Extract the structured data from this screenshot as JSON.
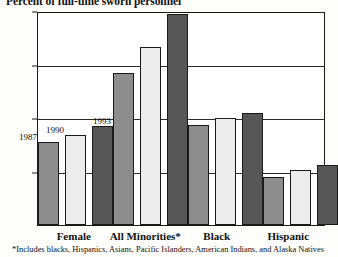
{
  "chart_data": {
    "type": "bar",
    "title": "Percent of full-time sworn personnel",
    "xlabel": "",
    "ylabel": "",
    "ylim": [
      0,
      20
    ],
    "ytick_labels": [
      "20%",
      "15%",
      "10%",
      "5%",
      "0%"
    ],
    "ytick_values": [
      20,
      15,
      10,
      5,
      0
    ],
    "grid": true,
    "legend_position": "inline-on-first-group",
    "categories": [
      "Female",
      "All Minorities*",
      "Black",
      "Hispanic"
    ],
    "series": [
      {
        "name": "1987",
        "color": "#8d8d8d",
        "values": [
          7.8,
          14.3,
          9.4,
          4.5
        ]
      },
      {
        "name": "1990",
        "color": "#ececec",
        "values": [
          8.5,
          16.8,
          10.1,
          5.2
        ]
      },
      {
        "name": "1993",
        "color": "#565656",
        "values": [
          9.3,
          19.9,
          10.6,
          5.7
        ]
      }
    ],
    "annotations": [
      "*Includes blacks, Hispanics, Asians, Pacific Islanders, American Indians, and Alaska Natives"
    ],
    "footnote": "*Includes blacks, Hispanics, Asians, Pacific Islanders, American Indians, and Alaska Natives"
  }
}
